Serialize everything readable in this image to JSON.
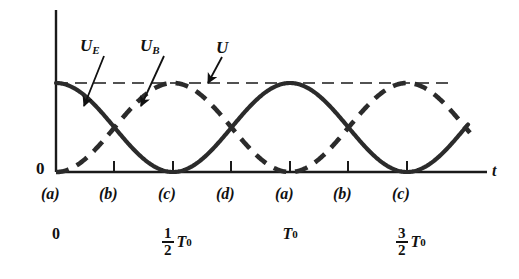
{
  "figure": {
    "background_color": "#ffffff",
    "ink_color": "#1a1a1a"
  },
  "axes": {
    "x_axis_label": "t",
    "y_origin_label": "0",
    "x_axis_start_px": 56,
    "x_axis_end_px": 487,
    "baseline_y_px": 172,
    "y_axis_top_px": 10,
    "total_energy_level_y_px": 83,
    "tick_spacing_px": 58.5,
    "grid": false
  },
  "curve_labels": [
    {
      "name": "U_E",
      "base": "U",
      "sub": "E",
      "x_px": 80,
      "y_px": 37,
      "arrow_from_x": 104,
      "arrow_from_y": 56,
      "arrow_to_x": 84,
      "arrow_to_y": 106
    },
    {
      "name": "U_B",
      "base": "U",
      "sub": "B",
      "x_px": 140,
      "y_px": 37,
      "arrow_from_x": 164,
      "arrow_from_y": 56,
      "arrow_to_x": 141,
      "arrow_to_y": 106
    },
    {
      "name": "U",
      "base": "U",
      "sub": "",
      "x_px": 216,
      "y_px": 39,
      "arrow_from_x": 222,
      "arrow_from_y": 57,
      "arrow_to_x": 208,
      "arrow_to_y": 83
    }
  ],
  "phase_labels": [
    {
      "text": "(a)",
      "x_px": 56
    },
    {
      "text": "(b)",
      "x_px": 114
    },
    {
      "text": "(c)",
      "x_px": 173
    },
    {
      "text": "(d)",
      "x_px": 231
    },
    {
      "text": "(a)",
      "x_px": 290
    },
    {
      "text": "(b)",
      "x_px": 348
    },
    {
      "text": "(c)",
      "x_px": 407
    }
  ],
  "time_labels": [
    {
      "whole": "0",
      "numerator": "",
      "denominator": "",
      "symbol": "",
      "sub": "",
      "x_px": 56
    },
    {
      "whole": "",
      "numerator": "1",
      "denominator": "2",
      "symbol": "T",
      "sub": "0",
      "x_px": 173
    },
    {
      "whole": "",
      "numerator": "",
      "denominator": "",
      "symbol": "T",
      "sub": "0",
      "x_px": 290
    },
    {
      "whole": "",
      "numerator": "3",
      "denominator": "2",
      "symbol": "T",
      "sub": "0",
      "x_px": 407
    }
  ],
  "chart_data": {
    "type": "line",
    "xlabel": "t",
    "ylabel": "",
    "xlim": [
      0,
      1.875
    ],
    "ylim": [
      0,
      1.12
    ],
    "x_unit": "T_0",
    "grid": false,
    "legend": "inline-annotations",
    "annotations": [
      {
        "text": "U",
        "meaning": "total energy, constant, horizontal dashed line at U = 1"
      },
      {
        "text": "U_E",
        "meaning": "electric field energy, solid curve, maximum at t = 0"
      },
      {
        "text": "U_B",
        "meaning": "magnetic field energy, dashed curve, zero at t = 0"
      }
    ],
    "x_tick_values": [
      0,
      0.25,
      0.5,
      0.75,
      1.0,
      1.25,
      1.5
    ],
    "x_tick_labels": [
      "(a)",
      "(b)",
      "(c)",
      "(d)",
      "(a)",
      "(b)",
      "(c)"
    ],
    "x_secondary_tick_labels": [
      "0",
      "",
      "1/2 T_0",
      "",
      "T_0",
      "",
      "3/2 T_0"
    ],
    "series": [
      {
        "name": "U_E",
        "style": "solid",
        "formula": "U_E(t) = U * cos^2(pi * t / T_0)",
        "x": [
          0,
          0.125,
          0.25,
          0.375,
          0.5,
          0.625,
          0.75,
          0.875,
          1.0,
          1.125,
          1.25,
          1.375,
          1.5,
          1.625
        ],
        "values": [
          1.0,
          0.5,
          0.0,
          0.5,
          1.0,
          0.5,
          0.0,
          0.5,
          1.0,
          0.5,
          0.0,
          0.5,
          1.0,
          0.5
        ]
      },
      {
        "name": "U_B",
        "style": "dashed",
        "formula": "U_B(t) = U * sin^2(pi * t / T_0)",
        "x": [
          0,
          0.125,
          0.25,
          0.375,
          0.5,
          0.625,
          0.75,
          0.875,
          1.0,
          1.125,
          1.25,
          1.375,
          1.5,
          1.625
        ],
        "values": [
          0.0,
          0.5,
          1.0,
          0.5,
          0.0,
          0.5,
          1.0,
          0.5,
          0.0,
          0.5,
          1.0,
          0.5,
          0.0,
          0.5
        ]
      },
      {
        "name": "U",
        "style": "dashed-thin-horizontal",
        "formula": "U = U_E + U_B = constant",
        "x": [
          0,
          1.7
        ],
        "values": [
          1.0,
          1.0
        ]
      }
    ]
  }
}
